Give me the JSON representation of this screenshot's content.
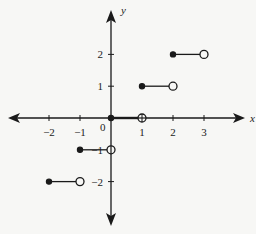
{
  "chart_data": {
    "type": "line",
    "title": "",
    "subtitle": "",
    "xlabel": "x",
    "ylabel": "y",
    "xlim": [
      -3.5,
      4.5
    ],
    "ylim": [
      -3,
      3.5
    ],
    "grid": false,
    "legend": null,
    "x_ticks": [
      -2,
      -1,
      1,
      2,
      3
    ],
    "x_tick_labels": [
      "−2",
      "−1",
      "1",
      "2",
      "3"
    ],
    "y_ticks": [
      2,
      1,
      -1,
      -2
    ],
    "y_tick_labels": [
      "2",
      "1",
      "−1",
      "−2"
    ],
    "origin_label": "0",
    "series": [
      {
        "name": "f(x)",
        "segments": [
          {
            "x_start": -2,
            "x_end": -1,
            "y": -2,
            "start_closed": true,
            "end_closed": false
          },
          {
            "x_start": -1,
            "x_end": 0,
            "y": -1,
            "start_closed": true,
            "end_closed": false
          },
          {
            "x_start": 0,
            "x_end": 1,
            "y": 0,
            "start_closed": true,
            "end_closed": false
          },
          {
            "x_start": 1,
            "x_end": 2,
            "y": 1,
            "start_closed": true,
            "end_closed": false
          },
          {
            "x_start": 2,
            "x_end": 3,
            "y": 2,
            "start_closed": true,
            "end_closed": false
          }
        ]
      }
    ]
  },
  "colors": {
    "background": "#f7f7f5",
    "ink": "#1a1a1a"
  }
}
